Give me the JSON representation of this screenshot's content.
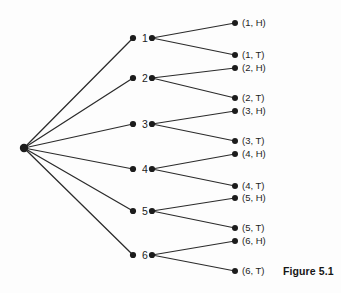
{
  "figure": {
    "caption": "Figure 5.1",
    "caption_position": {
      "x": 283,
      "y": 266
    },
    "background_color": "#fdfdfd",
    "ink_color": "#1c1c1c",
    "edge_color": "#2b2b2b"
  },
  "tree": {
    "root": {
      "name": "root-node",
      "x": 24,
      "y": 148,
      "radius": 4.2
    },
    "stage1": {
      "label_offset_x": 9,
      "in_dot_x": 133,
      "out_dot_x": 152,
      "dot_radius": 3.1,
      "nodes": [
        {
          "label": "1",
          "y": 38
        },
        {
          "label": "2",
          "y": 78
        },
        {
          "label": "3",
          "y": 124
        },
        {
          "label": "4",
          "y": 169
        },
        {
          "label": "5",
          "y": 211
        },
        {
          "label": "6",
          "y": 255
        }
      ]
    },
    "stage2": {
      "dot_x": 235,
      "dot_radius": 3.0,
      "label_offset_x": 7,
      "leaves": [
        {
          "label": "(1, H)",
          "y": 23,
          "parent": 0
        },
        {
          "label": "(1, T)",
          "y": 55,
          "parent": 0
        },
        {
          "label": "(2, H)",
          "y": 68,
          "parent": 1
        },
        {
          "label": "(2, T)",
          "y": 98,
          "parent": 1
        },
        {
          "label": "(3, H)",
          "y": 111,
          "parent": 2
        },
        {
          "label": "(3, T)",
          "y": 141,
          "parent": 2
        },
        {
          "label": "(4, H)",
          "y": 154,
          "parent": 3
        },
        {
          "label": "(4, T)",
          "y": 186,
          "parent": 3
        },
        {
          "label": "(5, H)",
          "y": 198,
          "parent": 4
        },
        {
          "label": "(5, T)",
          "y": 228,
          "parent": 4
        },
        {
          "label": "(6, H)",
          "y": 241,
          "parent": 5
        },
        {
          "label": "(6, T)",
          "y": 271,
          "parent": 5
        }
      ]
    }
  }
}
